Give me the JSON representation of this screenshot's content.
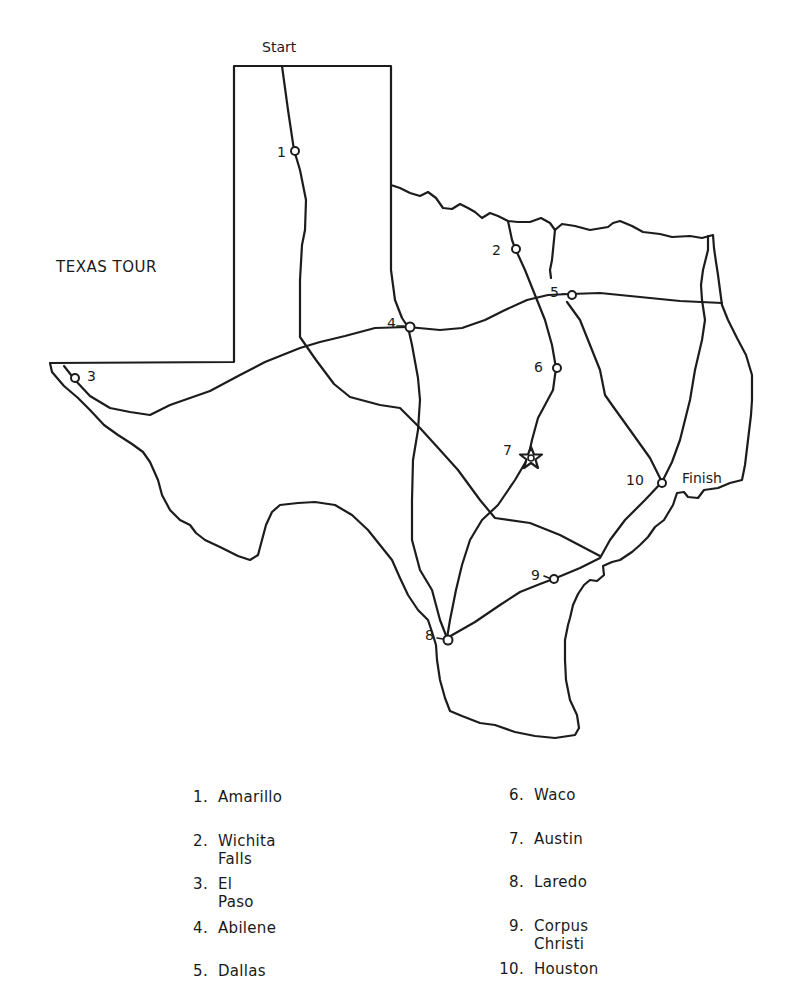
{
  "title": "TEXAS TOUR",
  "route_labels": {
    "start": "Start",
    "finish": "Finish"
  },
  "stops": [
    {
      "number": "1",
      "legend_number": "1.",
      "name": "Amarillo"
    },
    {
      "number": "2",
      "legend_number": "2.",
      "name": "Wichita Falls"
    },
    {
      "number": "3",
      "legend_number": "3.",
      "name": "El Paso"
    },
    {
      "number": "4",
      "legend_number": "4.",
      "name": "Abilene"
    },
    {
      "number": "5",
      "legend_number": "5.",
      "name": "Dallas"
    },
    {
      "number": "6",
      "legend_number": "6.",
      "name": "Waco"
    },
    {
      "number": "7",
      "legend_number": "7.",
      "name": "Austin",
      "marker": "star-icon (capital)"
    },
    {
      "number": "8",
      "legend_number": "8.",
      "name": "Laredo"
    },
    {
      "number": "9",
      "legend_number": "9.",
      "name": "Corpus Christi"
    },
    {
      "number": "10",
      "legend_number": "10.",
      "name": "Houston"
    }
  ],
  "colors": {
    "ink": "#1c1c1c",
    "paper": "#ffffff"
  }
}
